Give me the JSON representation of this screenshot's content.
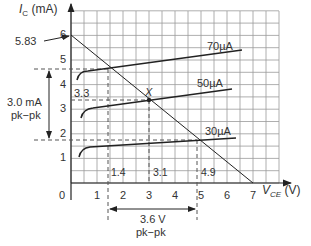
{
  "chart_data": {
    "type": "line",
    "title": "",
    "xlabel": "V_CE (V)",
    "ylabel": "I_C (mA)",
    "xlim": [
      0,
      8
    ],
    "ylim": [
      0,
      7
    ],
    "x_ticks": [
      "0",
      "1",
      "2",
      "3",
      "4",
      "5",
      "6",
      "7"
    ],
    "y_ticks": [
      "1",
      "2",
      "3",
      "4",
      "5",
      "6"
    ],
    "grid": true,
    "series": [
      {
        "name": "70µA",
        "points": [
          [
            0.25,
            3.9
          ],
          [
            0.5,
            4.4
          ],
          [
            1,
            4.55
          ],
          [
            2,
            4.65
          ],
          [
            4,
            5.0
          ],
          [
            6.5,
            5.4
          ]
        ]
      },
      {
        "name": "50µA",
        "points": [
          [
            0.4,
            2.6
          ],
          [
            0.7,
            3.0
          ],
          [
            1.5,
            3.1
          ],
          [
            3.1,
            3.35
          ],
          [
            6.2,
            3.8
          ]
        ]
      },
      {
        "name": "30µA",
        "points": [
          [
            0.3,
            1.05
          ],
          [
            0.6,
            1.4
          ],
          [
            1.5,
            1.5
          ],
          [
            4.9,
            1.7
          ],
          [
            6.3,
            1.8
          ]
        ]
      },
      {
        "name": "load line",
        "points": [
          [
            0,
            5.83
          ],
          [
            7,
            0
          ]
        ]
      }
    ],
    "annotations": {
      "y_intercept_label": "5.83",
      "q_point_label": "X",
      "q_point": [
        3.1,
        3.3
      ],
      "dashed_levels_mA": [
        4.7,
        3.3,
        1.7
      ],
      "dashed_levels_V": [
        1.4,
        3.1,
        4.9
      ],
      "i_labels": [
        "3.3"
      ],
      "v_labels": [
        "1.4",
        "3.1",
        "4.9"
      ],
      "current_swing": "3.0 mA",
      "current_swing_sub": "pk−pk",
      "voltage_swing": "3.6 V",
      "voltage_swing_sub": "pk−pk"
    }
  },
  "labels": {
    "y_axis": "I",
    "y_axis_sub": "C",
    "y_axis_unit": " (mA)",
    "x_axis": "V",
    "x_axis_sub": "CE",
    "x_axis_unit": " (V)",
    "s70": "70µA",
    "s50": "50µA",
    "s30": "30µA",
    "intercept": "5.83",
    "x_point": "X",
    "i33": "3.3",
    "v14": "1.4",
    "v31": "3.1",
    "v49": "4.9",
    "i_swing": "3.0 mA",
    "i_swing_sub": "pk−pk",
    "v_swing": "3.6 V",
    "v_swing_sub": "pk−pk",
    "ticks_x": [
      "0",
      "1",
      "2",
      "3",
      "4",
      "5",
      "6",
      "7"
    ],
    "ticks_y": [
      "1",
      "2",
      "3",
      "4",
      "5",
      "6"
    ]
  }
}
